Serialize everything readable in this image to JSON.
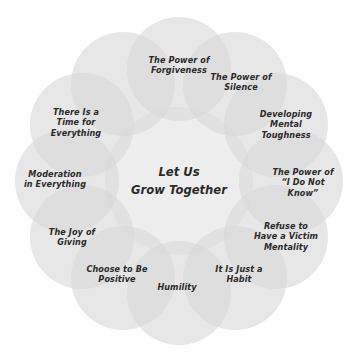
{
  "diagram": {
    "type": "circular-petal-diagram",
    "title": "Let Us Grow Together",
    "center": {
      "text": "Let Us\nGrow Together",
      "x": 179,
      "y": 181
    },
    "geometry": {
      "canvas_width": 358,
      "canvas_height": 362,
      "ring_center_x": 179,
      "ring_center_y": 181,
      "ring_radius": 112,
      "petal_radius": 52,
      "center_disc_radius": 74,
      "petal_count": 12,
      "start_angle_deg": -90
    },
    "colors": {
      "background": "#ffffff",
      "petal_fill": "#d8d8d8",
      "center_fill": "#e3e3e3",
      "text": "#2b2b2b"
    },
    "nodes": [
      {
        "id": "the-power-of-forgiveness",
        "text": "The Power of\nForgiveness",
        "angle_deg": -90,
        "label_dx": 0,
        "label_dy": -4
      },
      {
        "id": "the-power-of-silence",
        "text": "The Power of\nSilence",
        "angle_deg": -60,
        "label_dx": 6,
        "label_dy": -2
      },
      {
        "id": "developing-mental-toughness",
        "text": "Developing\nMental\nToughness",
        "angle_deg": -30,
        "label_dx": 10,
        "label_dy": 0
      },
      {
        "id": "the-power-of-i-do-not-know",
        "text": "The Power of\n“I Do Not\nKnow”",
        "angle_deg": 0,
        "label_dx": 12,
        "label_dy": 2
      },
      {
        "id": "refuse-to-have-a-victim-mentality",
        "text": "Refuse to\nHave a Victim\nMentality",
        "angle_deg": 30,
        "label_dx": 10,
        "label_dy": 0
      },
      {
        "id": "it-is-just-a-habit",
        "text": "It Is Just a\nHabit",
        "angle_deg": 60,
        "label_dx": 4,
        "label_dy": -4
      },
      {
        "id": "humility",
        "text": "Humility",
        "angle_deg": 90,
        "label_dx": -2,
        "label_dy": -6
      },
      {
        "id": "choose-to-be-positive",
        "text": "Choose to Be\nPositive",
        "angle_deg": 120,
        "label_dx": -6,
        "label_dy": -4
      },
      {
        "id": "the-joy-of-giving",
        "text": "The Joy of\nGiving",
        "angle_deg": 150,
        "label_dx": -10,
        "label_dy": 0
      },
      {
        "id": "moderation-in-everything",
        "text": "Moderation\nin Everything",
        "angle_deg": 180,
        "label_dx": -12,
        "label_dy": -2
      },
      {
        "id": "the-joy-of-moderation-upper",
        "text": "There Is a\nTime for\nEverything",
        "angle_deg": -150,
        "label_dx": -6,
        "label_dy": -2
      },
      {
        "id": "moderation-upper",
        "text": "",
        "angle_deg": -120,
        "label_dx": 0,
        "label_dy": 0
      }
    ],
    "labels_ordered": [
      "The Power of\nForgiveness",
      "The Power of\nSilence",
      "Developing\nMental\nToughness",
      "The Power of\n“I Do Not\nKnow”",
      "Refuse to\nHave a Victim\nMentality",
      "It Is Just a\nHabit",
      "Humility",
      "Choose to Be\nPositive",
      "The Joy of\nGiving",
      "Moderation\nin Everything",
      "There Is a\nTime for\nEverything"
    ]
  }
}
